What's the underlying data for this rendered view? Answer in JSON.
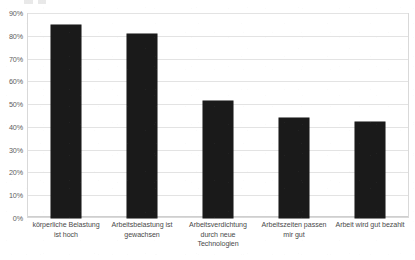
{
  "chart_data": {
    "type": "bar",
    "title": "",
    "subtitle": "",
    "xlabel": "",
    "ylabel": "",
    "categories": [
      "körperliche Belastung ist hoch",
      "Arbeitsbelastung ist gewachsen",
      "Arbeitsverdichtung durch neue Technologien",
      "Arbeitszeiten passen mir gut",
      "Arbeit wird gut bezahlt"
    ],
    "category_lines": [
      [
        "körperliche Belastung",
        "ist hoch"
      ],
      [
        "Arbeitsbelastung ist",
        "gewachsen"
      ],
      [
        "Arbeitsverdichtung",
        "durch neue",
        "Technologien"
      ],
      [
        "Arbeitszeiten passen",
        "mir gut"
      ],
      [
        "Arbeit wird gut bezahlt"
      ]
    ],
    "values": [
      85,
      81,
      51.5,
      44,
      42.5
    ],
    "value_labels": [
      "85%",
      "81%",
      "52%",
      "44%",
      "43%"
    ],
    "ylim": [
      0,
      90
    ],
    "ytick_step": 10,
    "ytick_labels": [
      "90%",
      "80%",
      "70%",
      "60%",
      "50%",
      "40%",
      "30%",
      "20%",
      "10%",
      "0%"
    ],
    "ytick_values": [
      90,
      80,
      70,
      60,
      50,
      40,
      30,
      20,
      10,
      0
    ],
    "grid": true,
    "legend": false,
    "legend_position": "none",
    "series": [
      {
        "name": "Anteil",
        "values": [
          85,
          81,
          51.5,
          44,
          42.5
        ]
      }
    ],
    "colors": {
      "bar": "#1a1a1a",
      "grid": "#e3e3e3",
      "border": "#d9d9d9",
      "axis_text": "#5c5c5c",
      "category_text": "#4a4a4a",
      "background": "#ffffff"
    }
  }
}
